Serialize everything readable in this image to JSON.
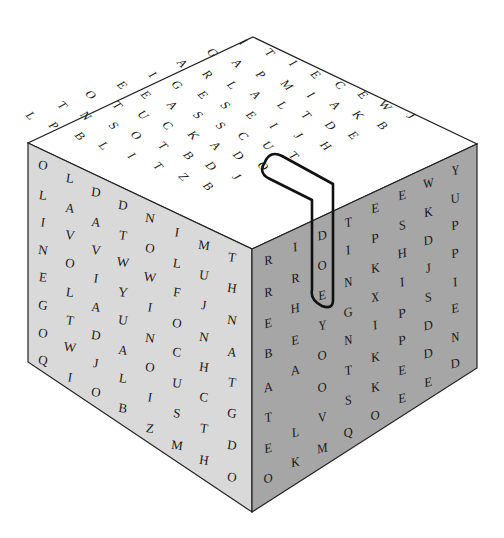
{
  "puzzle": {
    "type": "word-search-cube",
    "highlighted_word": "CUTTING",
    "colors": {
      "top_face": "#ffffff",
      "left_face": "#d9d9d9",
      "right_face": "#a6a6a6",
      "edge": "#222222",
      "letter": "#1a1a1a",
      "highlight_outline": "#111111"
    },
    "geometry": {
      "top": [
        253,
        37
      ],
      "left_top": [
        28,
        143
      ],
      "front_top": [
        252,
        249
      ],
      "right_top": [
        477,
        144
      ],
      "left_bottom": [
        28,
        362
      ],
      "front_bottom": [
        252,
        512
      ],
      "right_bottom": [
        477,
        368
      ]
    },
    "top_face": {
      "rows": [
        {
          "letters": [
            "I",
            "G",
            "A",
            "I",
            "E",
            "O",
            "T",
            "L"
          ],
          "pos": [
            [
              253,
              52
            ],
            [
              225,
              65
            ],
            [
              197,
              78
            ],
            [
              170,
              92
            ],
            [
              142,
              105
            ],
            [
              113,
              117
            ],
            [
              87,
              130
            ],
            [
              58,
              143
            ]
          ]
        },
        {
          "letters": [
            "T",
            "A",
            "R",
            "G",
            "E",
            "T",
            "N",
            "P"
          ],
          "pos": [
            [
              282,
              65
            ],
            [
              252,
              78
            ],
            [
              225,
              92
            ],
            [
              197,
              105
            ],
            [
              168,
              117
            ],
            [
              142,
              130
            ],
            [
              113,
              143
            ],
            [
              83,
              155
            ]
          ]
        },
        {
          "letters": [
            "I",
            "P",
            "L",
            "E",
            "A",
            "U",
            "S",
            "B"
          ],
          "pos": [
            [
              308,
              78
            ],
            [
              278,
              92
            ],
            [
              252,
              105
            ],
            [
              225,
              117
            ],
            [
              197,
              130
            ],
            [
              170,
              142
            ],
            [
              143,
              155
            ],
            [
              112,
              168
            ]
          ]
        },
        {
          "letters": [
            "E",
            "M",
            "A",
            "S",
            "S",
            "C",
            "O",
            "L"
          ],
          "pos": [
            [
              333,
              92
            ],
            [
              307,
              105
            ],
            [
              278,
              117
            ],
            [
              250,
              130
            ],
            [
              225,
              142
            ],
            [
              197,
              155
            ],
            [
              168,
              167
            ],
            [
              138,
              180
            ]
          ]
        },
        {
          "letters": [
            "C",
            "I",
            "L",
            "E",
            "S",
            "K",
            "T",
            "I"
          ],
          "pos": [
            [
              360,
              105
            ],
            [
              333,
              117
            ],
            [
              307,
              130
            ],
            [
              278,
              142
            ],
            [
              250,
              155
            ],
            [
              225,
              167
            ],
            [
              197,
              180
            ],
            [
              168,
              192
            ]
          ]
        },
        {
          "letters": [
            "E",
            "A",
            "T",
            "I",
            "C",
            "A",
            "B",
            "T"
          ],
          "pos": [
            [
              385,
              117
            ],
            [
              360,
              130
            ],
            [
              333,
              142
            ],
            [
              303,
              155
            ],
            [
              275,
              168
            ],
            [
              250,
              180
            ],
            [
              225,
              192
            ],
            [
              197,
              205
            ]
          ]
        },
        {
          "letters": [
            "W",
            "K",
            "D",
            "J",
            "U",
            "D",
            "D",
            "Z"
          ],
          "pos": [
            [
              410,
              130
            ],
            [
              385,
              142
            ],
            [
              360,
              155
            ],
            [
              330,
              167
            ],
            [
              302,
              180
            ],
            [
              275,
              192
            ],
            [
              250,
              205
            ],
            [
              225,
              218
            ]
          ]
        },
        {
          "letters": [
            "J",
            "B",
            "E",
            "H",
            "T",
            "O",
            "J",
            "B"
          ],
          "pos": [
            [
              438,
              143
            ],
            [
              412,
              155
            ],
            [
              385,
              167
            ],
            [
              360,
              180
            ],
            [
              330,
              192
            ],
            [
              302,
              205
            ],
            [
              278,
              218
            ],
            [
              252,
              230
            ]
          ]
        }
      ]
    },
    "left_face": {
      "columns": [
        {
          "x": 43,
          "letters": [
            "O",
            "L",
            "I",
            "N",
            "E",
            "G",
            "O",
            "Q"
          ],
          "y": [
            165,
            195,
            222,
            250,
            277,
            305,
            333,
            360
          ]
        },
        {
          "x": 70,
          "letters": [
            "L",
            "A",
            "V",
            "O",
            "L",
            "T",
            "W",
            "I"
          ],
          "y": [
            178,
            208,
            235,
            263,
            292,
            320,
            347,
            377
          ]
        },
        {
          "x": 96,
          "letters": [
            "D",
            "A",
            "V",
            "I",
            "A",
            "D",
            "J",
            "O"
          ],
          "y": [
            192,
            222,
            250,
            278,
            307,
            335,
            363,
            392
          ]
        },
        {
          "x": 123,
          "letters": [
            "D",
            "T",
            "W",
            "Y",
            "U",
            "A",
            "L",
            "B"
          ],
          "y": [
            205,
            235,
            262,
            292,
            320,
            350,
            378,
            408
          ]
        },
        {
          "x": 150,
          "letters": [
            "N",
            "O",
            "W",
            "I",
            "N",
            "O",
            "I",
            "Z"
          ],
          "y": [
            218,
            248,
            277,
            307,
            338,
            367,
            397,
            428
          ]
        },
        {
          "x": 177,
          "letters": [
            "I",
            "L",
            "F",
            "O",
            "C",
            "U",
            "S",
            "M"
          ],
          "y": [
            232,
            263,
            292,
            323,
            352,
            383,
            413,
            445
          ]
        },
        {
          "x": 204,
          "letters": [
            "M",
            "U",
            "J",
            "N",
            "H",
            "C",
            "T",
            "H"
          ],
          "y": [
            245,
            275,
            305,
            337,
            367,
            397,
            428,
            460
          ]
        },
        {
          "x": 232,
          "letters": [
            "T",
            "H",
            "N",
            "A",
            "T",
            "G",
            "D",
            "O"
          ],
          "y": [
            257,
            288,
            320,
            352,
            382,
            413,
            445,
            477
          ]
        }
      ]
    },
    "right_face": {
      "columns": [
        {
          "x": 268,
          "letters": [
            "R",
            "R",
            "E",
            "B",
            "A",
            "T",
            "E",
            "O"
          ],
          "y": [
            260,
            292,
            323,
            353,
            387,
            417,
            448,
            478
          ]
        },
        {
          "x": 295,
          "letters": [
            "I",
            "R",
            "H",
            "E",
            "A",
            "L",
            "K"
          ],
          "y": [
            247,
            278,
            308,
            340,
            370,
            432,
            462
          ]
        },
        {
          "x": 322,
          "letters": [
            "D",
            "O",
            "E",
            "Y",
            "O",
            "O",
            "V",
            "M"
          ],
          "y": [
            235,
            265,
            295,
            325,
            355,
            387,
            417,
            448
          ]
        },
        {
          "x": 348,
          "letters": [
            "T",
            "I",
            "N",
            "G",
            "N",
            "T",
            "S",
            "Q"
          ],
          "y": [
            222,
            250,
            282,
            312,
            340,
            370,
            400,
            432
          ]
        },
        {
          "x": 375,
          "letters": [
            "E",
            "P",
            "K",
            "X",
            "I",
            "K",
            "K",
            "O"
          ],
          "y": [
            208,
            238,
            268,
            297,
            325,
            357,
            387,
            415
          ]
        },
        {
          "x": 402,
          "letters": [
            "E",
            "S",
            "H",
            "I",
            "P",
            "P",
            "E",
            "E"
          ],
          "y": [
            195,
            225,
            253,
            282,
            313,
            340,
            370,
            398
          ]
        },
        {
          "x": 428,
          "letters": [
            "W",
            "K",
            "D",
            "J",
            "S",
            "D",
            "D",
            "E"
          ],
          "y": [
            183,
            212,
            240,
            268,
            297,
            325,
            353,
            382
          ]
        },
        {
          "x": 455,
          "letters": [
            "Y",
            "U",
            "P",
            "P",
            "I",
            "E",
            "N",
            "D"
          ],
          "y": [
            170,
            198,
            225,
            253,
            282,
            308,
            337,
            363
          ]
        }
      ]
    }
  }
}
